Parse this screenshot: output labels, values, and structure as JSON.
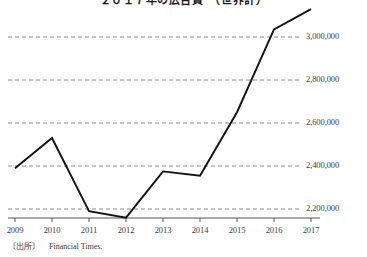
{
  "chart_data": {
    "type": "line",
    "title": "２０１７年の広告費　（世界計）",
    "title_clipped": true,
    "xlabel": "",
    "ylabel": "",
    "x": [
      2009,
      2010,
      2011,
      2012,
      2013,
      2014,
      2015,
      2016,
      2017
    ],
    "categories": [
      "2009",
      "2010",
      "2011",
      "2012",
      "2013",
      "2014",
      "2015",
      "2016",
      "2017"
    ],
    "values": [
      2390000,
      2530000,
      2190000,
      2160000,
      2375000,
      2355000,
      2650000,
      3035000,
      3130000
    ],
    "series": [
      {
        "name": "",
        "values": [
          2390000,
          2530000,
          2190000,
          2160000,
          2375000,
          2355000,
          2650000,
          3035000,
          3130000
        ]
      }
    ],
    "ytick_labels": [
      "3,000,000",
      "2,800,000",
      "2,600,000",
      "2,400,000",
      "2,200,000"
    ],
    "ytick_values": [
      3000000,
      2800000,
      2600000,
      2400000,
      2200000
    ],
    "ylim": [
      2158000,
      3160000
    ],
    "xlim": [
      2009,
      2017
    ],
    "grid": "horizontal-dashed",
    "legend": "none",
    "line_color": "#111111",
    "grid_color": "#8c8c8c",
    "axis_color": "#555555"
  },
  "source": {
    "tag": "〔出所〕",
    "text": "Financial Times."
  }
}
